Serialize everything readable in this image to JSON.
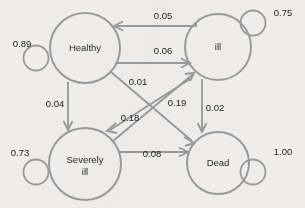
{
  "diagram": {
    "type": "state-transition-diagram",
    "background_color": "#efeeec",
    "stroke_color": "#9a9a9a",
    "text_color": "#1d1d1d",
    "nodes": [
      {
        "id": "healthy",
        "label": "Healthy",
        "label_line1": "Healthy",
        "label_line2": "",
        "cx": 85,
        "cy": 48,
        "r": 35
      },
      {
        "id": "ill",
        "label": "ill",
        "label_line1": "ill",
        "label_line2": "",
        "cx": 218,
        "cy": 47,
        "r": 33
      },
      {
        "id": "severely",
        "label": "Severely ill",
        "label_line1": "Severely",
        "label_line2": "ill",
        "cx": 85,
        "cy": 164,
        "r": 36
      },
      {
        "id": "dead",
        "label": "Dead",
        "label_line1": "Dead",
        "label_line2": "",
        "cx": 218,
        "cy": 163,
        "r": 31
      }
    ],
    "self_loops": [
      {
        "id": "healthy-self",
        "node": "healthy",
        "value": "0.89",
        "label_x": 22,
        "label_y": 44
      },
      {
        "id": "ill-self",
        "node": "ill",
        "value": "0.75",
        "label_x": 283,
        "label_y": 13
      },
      {
        "id": "severely-self",
        "node": "severely",
        "value": "0.73",
        "label_x": 20,
        "label_y": 153
      },
      {
        "id": "dead-self",
        "node": "dead",
        "value": "1.00",
        "label_x": 283,
        "label_y": 152
      }
    ],
    "edges": [
      {
        "id": "ill-to-healthy",
        "from": "ill",
        "to": "healthy",
        "value": "0.05",
        "label_x": 163,
        "label_y": 16
      },
      {
        "id": "healthy-to-ill",
        "from": "healthy",
        "to": "ill",
        "value": "0.06",
        "label_x": 163,
        "label_y": 51
      },
      {
        "id": "healthy-to-dead",
        "from": "healthy",
        "to": "dead",
        "value": "0.01",
        "label_x": 138,
        "label_y": 82
      },
      {
        "id": "severely-to-ill",
        "from": "severely",
        "to": "ill",
        "value": "0.19",
        "label_x": 177,
        "label_y": 103
      },
      {
        "id": "ill-to-severely",
        "from": "ill",
        "to": "severely",
        "value": "0.18",
        "label_x": 130,
        "label_y": 118
      },
      {
        "id": "healthy-to-severely",
        "from": "healthy",
        "to": "severely",
        "value": "0.04",
        "label_x": 55,
        "label_y": 104
      },
      {
        "id": "ill-to-dead",
        "from": "ill",
        "to": "dead",
        "value": "0.02",
        "label_x": 215,
        "label_y": 108
      },
      {
        "id": "severely-to-dead",
        "from": "severely",
        "to": "dead",
        "value": "0.08",
        "label_x": 152,
        "label_y": 154
      }
    ]
  }
}
